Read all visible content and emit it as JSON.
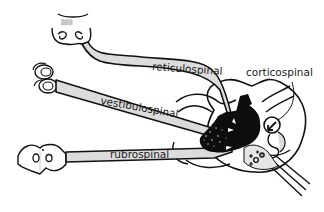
{
  "diagram": {
    "type": "neuroanatomy-pathways",
    "labels": {
      "reticulospinal": "reticulospinal",
      "vestibulospinal": "vestibulospinal",
      "rubrospinal": "rubrospinal",
      "corticospinal": "corticospinal"
    },
    "sources": [
      {
        "name": "reticular-formation",
        "tract": "reticulospinal"
      },
      {
        "name": "vestibular-nuclei",
        "tract": "vestibulospinal"
      },
      {
        "name": "red-nucleus",
        "tract": "rubrospinal"
      }
    ],
    "target": "spinal-cord-cross-section",
    "colors": {
      "tract_fill": "#dcdcdc",
      "outline": "#111111",
      "background": "#ffffff",
      "motor_pool": "#0d0d0d"
    }
  }
}
